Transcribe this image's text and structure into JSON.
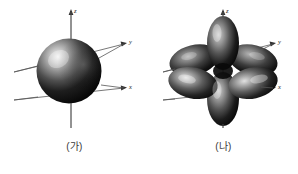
{
  "figure": {
    "background_color": "#ffffff",
    "axis_line_color": "#555555",
    "label_color": "#1a1a1a",
    "caption_color": "#3a3a3a",
    "orbital_dark": "#0b0b0b",
    "orbital_mid": "#4a4a4a",
    "orbital_light": "#e8e8e8",
    "panels": [
      {
        "id": "a",
        "caption": "(가)",
        "orbital_type": "s",
        "lobe_count": 1,
        "axes": [
          {
            "name": "z",
            "label": "z",
            "direction": "up"
          },
          {
            "name": "y",
            "label": "y",
            "direction": "upper-right"
          },
          {
            "name": "x",
            "label": "x",
            "direction": "lower-right"
          }
        ]
      },
      {
        "id": "b",
        "caption": "(나)",
        "orbital_type": "p-set",
        "lobe_count": 6,
        "axes": [
          {
            "name": "z",
            "label": "z",
            "direction": "up"
          },
          {
            "name": "y",
            "label": "y",
            "direction": "upper-right"
          },
          {
            "name": "x",
            "label": "x",
            "direction": "lower-right"
          }
        ]
      }
    ]
  }
}
